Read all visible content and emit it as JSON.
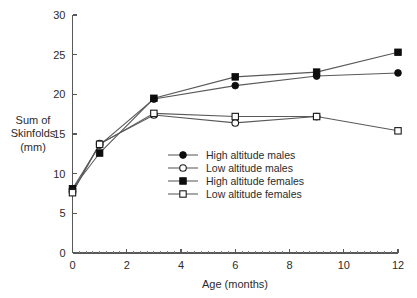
{
  "chart_data": {
    "type": "line",
    "title": "",
    "xlabel": "Age (months)",
    "ylabel": "Sum of Skinfolds (mm)",
    "ylabel_lines": [
      "Sum of",
      "Skinfolds",
      "(mm)"
    ],
    "xlim": [
      0,
      12
    ],
    "ylim": [
      0,
      30
    ],
    "x_ticks": [
      0,
      2,
      4,
      6,
      8,
      10,
      12
    ],
    "x_tick_labels": [
      "0",
      "2",
      "4",
      "6",
      "8",
      "10",
      "12"
    ],
    "x_minor_step": 0.25,
    "y_ticks": [
      0,
      5,
      10,
      15,
      20,
      25,
      30
    ],
    "y_tick_labels": [
      "0",
      "5",
      "10",
      "15",
      "20",
      "25",
      "30"
    ],
    "grid": false,
    "legend_position": "center",
    "x": [
      0,
      1,
      3,
      6,
      9,
      12
    ],
    "series": [
      {
        "name": "High altitude males",
        "marker": "filled-circle",
        "values": [
          8.1,
          13.6,
          19.4,
          21.1,
          22.3,
          22.7
        ]
      },
      {
        "name": "Low altitude males",
        "marker": "open-circle",
        "values": [
          7.7,
          13.8,
          17.4,
          16.4,
          17.2,
          null
        ]
      },
      {
        "name": "High altitude females",
        "marker": "filled-square",
        "values": [
          8.1,
          12.6,
          19.5,
          22.2,
          22.8,
          25.3
        ]
      },
      {
        "name": "Low altitude females",
        "marker": "open-square",
        "values": [
          7.6,
          13.7,
          17.6,
          17.2,
          17.2,
          15.4
        ]
      }
    ]
  },
  "legend": {
    "entries": [
      {
        "label": "High altitude males",
        "marker": "filled-circle"
      },
      {
        "label": "Low altitude males",
        "marker": "open-circle"
      },
      {
        "label": "High altitude females",
        "marker": "filled-square"
      },
      {
        "label": "Low altitude females",
        "marker": "open-square"
      }
    ]
  },
  "colors": {
    "marker_fill": "#0d0d0d",
    "marker_open_fill": "#ffffff",
    "line": "#59595b",
    "axis": "#58595b",
    "text": "#2b2b2b",
    "background": "#ffffff"
  }
}
